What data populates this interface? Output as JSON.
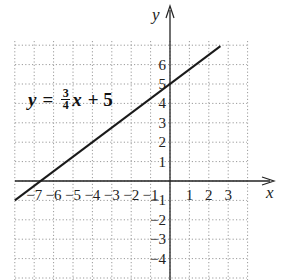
{
  "chart_data": {
    "type": "line",
    "title": "",
    "equation": {
      "lhs": "y",
      "equals": "=",
      "numerator": "3",
      "denominator": "4",
      "var": "x",
      "rest": "+ 5",
      "full": "y = (3/4)x + 5"
    },
    "xlabel": "x",
    "ylabel": "y",
    "xlim": [
      -8,
      4
    ],
    "ylim": [
      -5,
      7
    ],
    "grid": true,
    "x_ticks": [
      "−7",
      "−6",
      "−5",
      "−4",
      "−3",
      "−2",
      "−1",
      "1",
      "2",
      "3"
    ],
    "y_ticks": [
      "6",
      "5",
      "4",
      "3",
      "2",
      "1",
      "−1",
      "−2",
      "−3",
      "−4"
    ],
    "series": [
      {
        "name": "y = 3/4 x + 5",
        "slope": 0.75,
        "intercept": 5,
        "x": [
          -8,
          2.67
        ],
        "y": [
          -1,
          7
        ]
      }
    ],
    "key_points": [
      {
        "label": "y-intercept",
        "x": 0,
        "y": 5
      },
      {
        "label": "x-intercept",
        "x": -6.67,
        "y": 0
      }
    ],
    "colors": {
      "line": "#1a1a1a",
      "grid": "#9a9a9a",
      "axis": "#222222"
    }
  }
}
